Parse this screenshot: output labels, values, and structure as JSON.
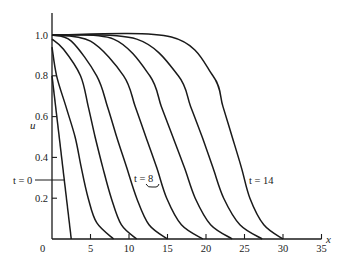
{
  "chart_data": {
    "type": "line",
    "title": "",
    "xlabel": "x",
    "ylabel": "u",
    "xlim": [
      0,
      35
    ],
    "ylim": [
      0,
      1.05
    ],
    "grid": false,
    "legend": "none (inline annotations)",
    "x_ticks": [
      "0",
      "5",
      "10",
      "15",
      "20",
      "25",
      "30",
      "35"
    ],
    "y_ticks": [
      "0.2",
      "0.4",
      "0.6",
      "0.8",
      "1.0"
    ],
    "origin_label": "0",
    "series": [
      {
        "name": "t = 0",
        "points": [
          [
            0,
            0.8
          ],
          [
            2.5,
            0
          ]
        ]
      },
      {
        "name": "t = 2",
        "points": [
          [
            0,
            0.94
          ],
          [
            0.6,
            0.8
          ],
          [
            1.8,
            0.65
          ],
          [
            3.0,
            0.5
          ],
          [
            3.8,
            0.35
          ],
          [
            4.7,
            0.2
          ],
          [
            5.8,
            0.08
          ],
          [
            8.0,
            0
          ]
        ]
      },
      {
        "name": "t = 4",
        "points": [
          [
            0,
            0.98
          ],
          [
            1.5,
            0.93
          ],
          [
            3.7,
            0.8
          ],
          [
            4.7,
            0.65
          ],
          [
            5.6,
            0.5
          ],
          [
            6.6,
            0.35
          ],
          [
            7.7,
            0.2
          ],
          [
            9.0,
            0.07
          ],
          [
            11.0,
            0
          ]
        ]
      },
      {
        "name": "t = 6",
        "points": [
          [
            0,
            1.0
          ],
          [
            2.5,
            0.97
          ],
          [
            5.8,
            0.8
          ],
          [
            7.2,
            0.65
          ],
          [
            8.4,
            0.5
          ],
          [
            9.7,
            0.35
          ],
          [
            11.0,
            0.2
          ],
          [
            12.6,
            0.07
          ],
          [
            15.0,
            0
          ]
        ]
      },
      {
        "name": "t = 8",
        "points": [
          [
            0,
            1.0
          ],
          [
            5.0,
            0.97
          ],
          [
            9.3,
            0.8
          ],
          [
            10.8,
            0.65
          ],
          [
            12.2,
            0.5
          ],
          [
            13.6,
            0.35
          ],
          [
            14.9,
            0.2
          ],
          [
            16.8,
            0.07
          ],
          [
            19.6,
            0
          ]
        ]
      },
      {
        "name": "t = 10",
        "points": [
          [
            0,
            1.0
          ],
          [
            8.0,
            0.98
          ],
          [
            12.7,
            0.8
          ],
          [
            14.2,
            0.65
          ],
          [
            15.7,
            0.5
          ],
          [
            17.2,
            0.35
          ],
          [
            18.6,
            0.2
          ],
          [
            20.6,
            0.07
          ],
          [
            23.4,
            0
          ]
        ]
      },
      {
        "name": "t = 12",
        "points": [
          [
            0,
            1.0
          ],
          [
            11.0,
            0.98
          ],
          [
            16.4,
            0.8
          ],
          [
            18.0,
            0.65
          ],
          [
            19.5,
            0.5
          ],
          [
            20.9,
            0.35
          ],
          [
            22.3,
            0.2
          ],
          [
            24.4,
            0.07
          ],
          [
            27.3,
            0
          ]
        ]
      },
      {
        "name": "t = 14",
        "points": [
          [
            0,
            1.0
          ],
          [
            15.5,
            0.99
          ],
          [
            20.9,
            0.8
          ],
          [
            22.2,
            0.65
          ],
          [
            23.4,
            0.5
          ],
          [
            24.6,
            0.35
          ],
          [
            25.7,
            0.2
          ],
          [
            27.5,
            0.07
          ],
          [
            30.0,
            0
          ]
        ]
      }
    ],
    "annotations": [
      {
        "text": "t = 0",
        "target_series": "t = 0"
      },
      {
        "text": "t = 8",
        "target_series": "t = 8"
      },
      {
        "text": "t = 14",
        "target_series": "t = 14"
      }
    ]
  }
}
